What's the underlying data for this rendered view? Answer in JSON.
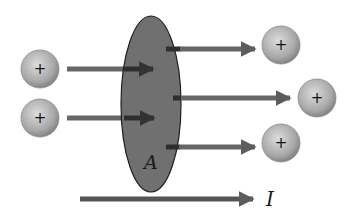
{
  "diagram": {
    "area_label": "A",
    "current_label": "I",
    "charge_symbol": "+",
    "colors": {
      "background": "#ffffff",
      "area_fill": "#6e6e6e",
      "area_stroke": "#1e1e1e",
      "arrow": "#5a5a5a",
      "arrow_dark": "#2e2e2e",
      "charge_light": "#d8d8d8",
      "charge_dark": "#8a8a8a"
    },
    "charges": [
      {
        "id": "left-top",
        "x": 40,
        "y": 69,
        "r": 19
      },
      {
        "id": "left-bottom",
        "x": 40,
        "y": 118,
        "r": 19
      },
      {
        "id": "right-top",
        "x": 281,
        "y": 45,
        "r": 19
      },
      {
        "id": "right-middle",
        "x": 317,
        "y": 98,
        "r": 19
      },
      {
        "id": "right-bottom",
        "x": 281,
        "y": 143,
        "r": 19
      }
    ]
  }
}
